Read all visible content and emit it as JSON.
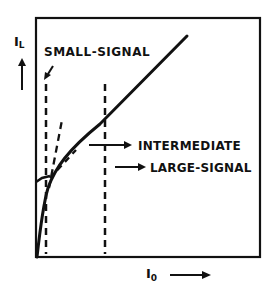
{
  "diagram": {
    "type": "transistor-characteristic-sketch",
    "axes": {
      "y_label_main": "I",
      "y_label_sub": "L",
      "x_label_main": "I",
      "x_label_sub": "0"
    },
    "annotations": {
      "small_signal": "SMALL-SIGNAL",
      "intermediate": "INTERMEDIATE",
      "large_signal": "LARGE-SIGNAL"
    },
    "colors": {
      "ink": "#111111",
      "background": "#ffffff"
    }
  }
}
